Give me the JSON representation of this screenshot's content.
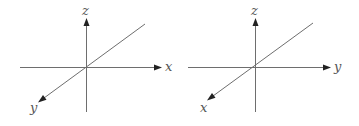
{
  "figure": {
    "background": "#ffffff",
    "axis_color": "#6e6e6e",
    "arrow_color": "#222222",
    "label_color": "#555555"
  },
  "diagrams": [
    {
      "name": "right-handed-axes-left",
      "labels": {
        "vertical": "z",
        "horizontal": "x",
        "diagonal": "y"
      }
    },
    {
      "name": "axes-right",
      "labels": {
        "vertical": "z",
        "horizontal": "y",
        "diagonal": "x"
      }
    }
  ]
}
